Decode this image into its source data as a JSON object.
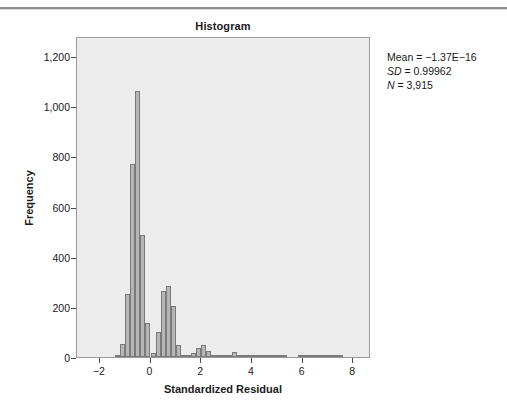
{
  "figure": {
    "title": "Histogram"
  },
  "stats": {
    "mean_label": "Mean",
    "mean_value": "−1.37E−16",
    "mean_line": "Mean = −1.37E−16",
    "sd_label": "SD",
    "sd_value": "0.99962",
    "sd_line": "SD = 0.99962",
    "n_label": "N",
    "n_value": "3,915",
    "n_line": "N = 3,915"
  },
  "colors": {
    "bar_fill": "#b6b6b6",
    "bar_stroke": "#7a7a7a",
    "plot_background": "#ececec",
    "frame": "#9a9a9a",
    "text": "#1a1a1a"
  },
  "chart_data": {
    "type": "bar",
    "title": "Histogram",
    "xlabel": "Standardized Residual",
    "ylabel": "Frequency",
    "xlim": [
      -2.9,
      8.7
    ],
    "ylim": [
      0,
      1280
    ],
    "xticks": [
      -2,
      0,
      2,
      4,
      6,
      8
    ],
    "xticklabels": [
      "−2",
      "0",
      "2",
      "4",
      "6",
      "8"
    ],
    "yticks": [
      0,
      200,
      400,
      600,
      800,
      1000,
      1200
    ],
    "yticklabels": [
      "0",
      "200",
      "400",
      "600",
      "800",
      "1,000",
      "1,200"
    ],
    "grid": false,
    "legend": null,
    "bin_width": 0.2,
    "annotations": [
      "Mean = −1.37E−16",
      "SD = 0.99962",
      "N = 3,915"
    ],
    "bin_centers": [
      -1.3,
      -1.1,
      -0.9,
      -0.7,
      -0.5,
      -0.3,
      -0.1,
      0.1,
      0.3,
      0.5,
      0.7,
      0.9,
      1.1,
      1.3,
      1.5,
      1.7,
      1.9,
      2.1,
      2.3,
      2.5,
      2.7,
      2.9,
      3.1,
      3.3,
      3.5,
      3.7,
      3.9,
      4.1,
      4.3,
      4.5,
      4.7,
      4.9,
      5.1,
      5.3,
      5.5,
      5.7,
      5.9,
      6.1,
      6.3,
      6.5,
      6.7,
      6.9,
      7.1,
      7.3,
      7.5
    ],
    "values": [
      3,
      50,
      253,
      770,
      1060,
      487,
      137,
      16,
      98,
      262,
      285,
      205,
      48,
      4,
      3,
      18,
      36,
      47,
      22,
      3,
      2,
      2,
      4,
      20,
      9,
      3,
      2,
      1,
      2,
      8,
      6,
      2,
      1,
      1,
      0,
      0,
      1,
      1,
      2,
      3,
      8,
      7,
      6,
      2,
      1
    ]
  }
}
